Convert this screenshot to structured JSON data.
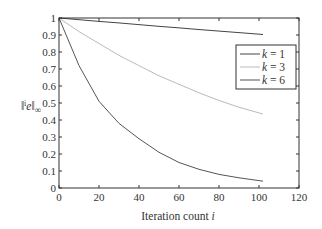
{
  "chart_data": {
    "type": "line",
    "title": "",
    "xlabel": "Iteration count i",
    "ylabel": "‖ⁱe‖∞",
    "xlim": [
      0,
      120
    ],
    "ylim": [
      0,
      1
    ],
    "xticks": [
      0,
      20,
      40,
      60,
      80,
      100,
      120
    ],
    "yticks": [
      0,
      0.1,
      0.2,
      0.3,
      0.4,
      0.5,
      0.6,
      0.7,
      0.8,
      0.9,
      1
    ],
    "grid": false,
    "legend_position": "upper right (inside, below top)",
    "x": [
      0,
      10,
      20,
      30,
      40,
      50,
      60,
      70,
      80,
      90,
      102
    ],
    "series": [
      {
        "name": "k = 1",
        "color": "#444444",
        "values": [
          1.0,
          0.99,
          0.98,
          0.971,
          0.961,
          0.951,
          0.942,
          0.932,
          0.923,
          0.914,
          0.903
        ]
      },
      {
        "name": "k = 3",
        "color": "#bbbbbb",
        "values": [
          1.0,
          0.92,
          0.85,
          0.78,
          0.72,
          0.66,
          0.61,
          0.56,
          0.515,
          0.475,
          0.435
        ]
      },
      {
        "name": "k = 6",
        "color": "#555555",
        "values": [
          1.0,
          0.72,
          0.51,
          0.38,
          0.29,
          0.21,
          0.15,
          0.11,
          0.08,
          0.06,
          0.04
        ]
      }
    ]
  },
  "labels": {
    "xlabel": "Iteration count i",
    "ylabel_main": "e",
    "ylabel_sup": "i",
    "ylabel_sub": "∞"
  }
}
